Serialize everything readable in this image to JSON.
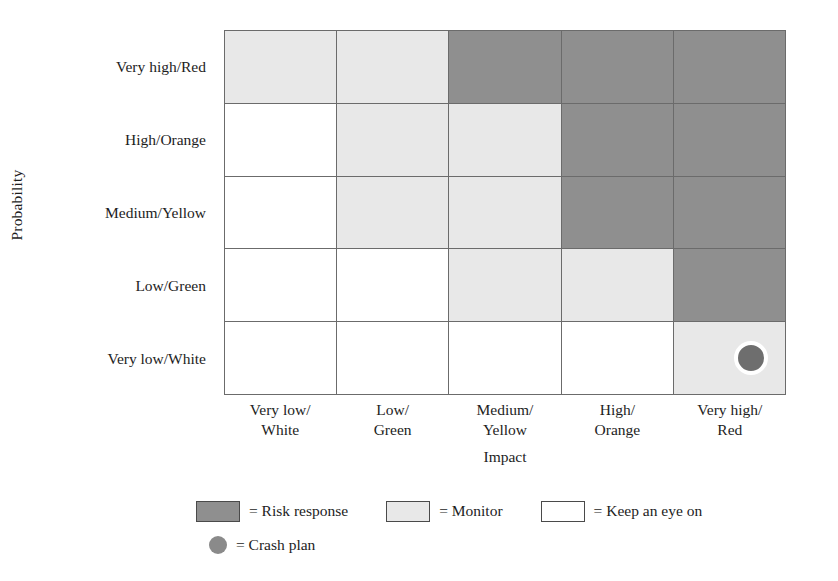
{
  "axes": {
    "y_title": "Probability",
    "x_title": "Impact",
    "y_ticks": [
      "Very high/Red",
      "High/Orange",
      "Medium/Yellow",
      "Low/Green",
      "Very low/White"
    ],
    "x_ticks": [
      {
        "line1": "Very low/",
        "line2": "White"
      },
      {
        "line1": "Low/",
        "line2": "Green"
      },
      {
        "line1": "Medium/",
        "line2": "Yellow"
      },
      {
        "line1": "High/",
        "line2": "Orange"
      },
      {
        "line1": "Very high/",
        "line2": "Red"
      }
    ]
  },
  "legend": {
    "items": [
      {
        "name": "risk-response",
        "marker": "dark-swatch",
        "label": "= Risk response"
      },
      {
        "name": "monitor",
        "marker": "light-swatch",
        "label": "= Monitor"
      },
      {
        "name": "keep-an-eye-on",
        "marker": "white-swatch",
        "label": "= Keep an eye on"
      },
      {
        "name": "crash-plan",
        "marker": "circle",
        "label": "= Crash plan"
      }
    ]
  },
  "colors": {
    "dark": "#8f8f8f",
    "light": "#e8e8e8",
    "white": "#ffffff",
    "grid_line": "#6b6b6b",
    "marker_fill": "#6e6e6e",
    "marker_ring": "#ffffff"
  },
  "chart_data": {
    "type": "heatmap",
    "title": "",
    "xlabel": "Impact",
    "ylabel": "Probability",
    "x_categories": [
      "Very low/White",
      "Low/Green",
      "Medium/Yellow",
      "High/Orange",
      "Very high/Red"
    ],
    "y_categories": [
      "Very high/Red",
      "High/Orange",
      "Medium/Yellow",
      "Low/Green",
      "Very low/White"
    ],
    "levels": {
      "dark": "Risk response",
      "light": "Monitor",
      "white": "Keep an eye on"
    },
    "rows": [
      {
        "probability": "Very high/Red",
        "cells": [
          "light",
          "light",
          "dark",
          "dark",
          "dark"
        ]
      },
      {
        "probability": "High/Orange",
        "cells": [
          "white",
          "light",
          "light",
          "dark",
          "dark"
        ]
      },
      {
        "probability": "Medium/Yellow",
        "cells": [
          "white",
          "light",
          "light",
          "dark",
          "dark"
        ]
      },
      {
        "probability": "Low/Green",
        "cells": [
          "white",
          "white",
          "light",
          "light",
          "dark"
        ]
      },
      {
        "probability": "Very low/White",
        "cells": [
          "white",
          "white",
          "white",
          "white",
          "light"
        ]
      }
    ],
    "markers": [
      {
        "name": "crash-plan",
        "probability": "Very low/White",
        "impact": "Very high/Red",
        "row": 4,
        "col": 4
      }
    ],
    "legend_position": "bottom",
    "grid": true
  }
}
